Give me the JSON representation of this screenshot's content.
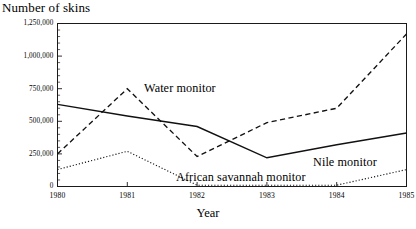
{
  "chart_data": {
    "type": "line",
    "title": "",
    "xlabel": "Year",
    "ylabel": "Number of skins",
    "x": [
      1980,
      1981,
      1982,
      1983,
      1984,
      1985
    ],
    "xtick_labels": [
      "1980",
      "1981",
      "1982",
      "1983",
      "1984",
      "1985"
    ],
    "xlim": [
      1980,
      1985
    ],
    "ylim": [
      0,
      1250000
    ],
    "ytick_values": [
      0,
      250000,
      500000,
      750000,
      1000000,
      1250000
    ],
    "ytick_labels": [
      "0",
      "250,000",
      "500,000",
      "750,000",
      "1,000,000",
      "1,250,000"
    ],
    "grid": false,
    "legend_position": "inline-annotations",
    "series": [
      {
        "name": "Water monitor",
        "style": "dashed",
        "color": "#111111",
        "values": [
          250000,
          750000,
          230000,
          490000,
          600000,
          1170000
        ]
      },
      {
        "name": "Nile monitor",
        "style": "solid",
        "color": "#111111",
        "values": [
          630000,
          540000,
          460000,
          220000,
          320000,
          410000
        ]
      },
      {
        "name": "African savannah monitor",
        "style": "dotted",
        "color": "#111111",
        "values": [
          130000,
          270000,
          10000,
          10000,
          10000,
          130000
        ]
      }
    ],
    "annotations": [
      {
        "text": "Water monitor",
        "series": "Water monitor"
      },
      {
        "text": "Nile monitor",
        "series": "Nile monitor"
      },
      {
        "text": "African savannah monitor",
        "series": "African savannah monitor"
      }
    ]
  }
}
